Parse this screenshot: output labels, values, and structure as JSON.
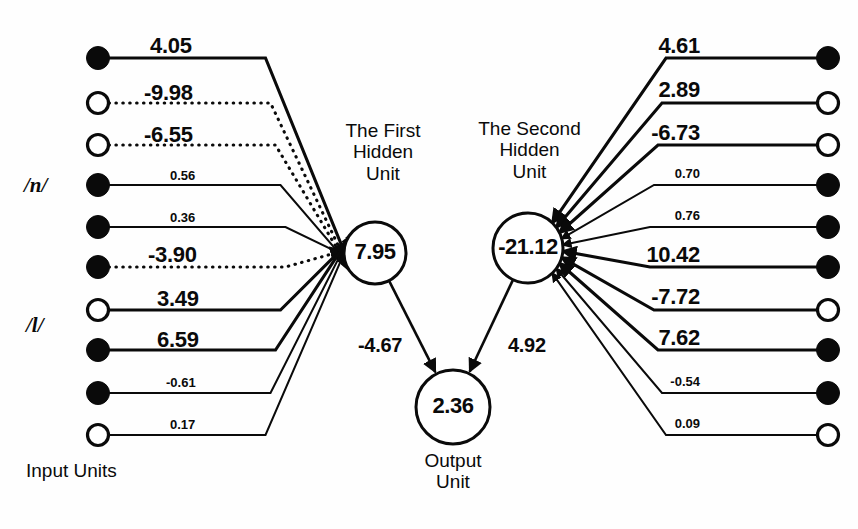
{
  "figure": {
    "type": "neural-network-diagram",
    "canvas": {
      "width": 858,
      "height": 529
    },
    "ink_color": "#0a0a0a",
    "background_color": "#fefefe"
  },
  "captions": {
    "first_hidden": "The First\nHidden\nUnit",
    "first_hidden_line1": "The First",
    "first_hidden_line2": "Hidden",
    "first_hidden_line3": "Unit",
    "second_hidden_line1": "The Second",
    "second_hidden_line2": "Hidden",
    "second_hidden_line3": "Unit",
    "output_line1": "Output",
    "output_line2": "Unit",
    "input_units": "Input  Units",
    "phoneme_n": "/n/",
    "phoneme_l": "/l/"
  },
  "units": {
    "first_hidden": {
      "label": "7.95",
      "cx": 375,
      "cy": 253,
      "r": 31
    },
    "second_hidden": {
      "label": "-21.12",
      "cx": 528,
      "cy": 248,
      "r": 35
    },
    "output": {
      "label": "2.36",
      "cx": 453,
      "cy": 407,
      "r": 37
    }
  },
  "inter_unit_weights": [
    {
      "name": "first-hidden-to-output",
      "value": "-4.67",
      "x": 358,
      "y": 334,
      "size": "mid"
    },
    {
      "name": "second-hidden-to-output",
      "value": "4.92",
      "x": 508,
      "y": 334,
      "size": "mid"
    }
  ],
  "left_inputs": {
    "node_x": 98,
    "label_x": 150,
    "nodes": [
      {
        "index": 0,
        "y": 58,
        "fill": "filled",
        "weight": "4.05",
        "line": "solid",
        "size": "big",
        "label_x": 150,
        "label_y": 33
      },
      {
        "index": 1,
        "y": 103,
        "fill": "open",
        "weight": "-9.98",
        "line": "dotted",
        "size": "big",
        "label_x": 144,
        "label_y": 80
      },
      {
        "index": 2,
        "y": 145,
        "fill": "open",
        "weight": "-6.55",
        "line": "dotted",
        "size": "big",
        "label_x": 144,
        "label_y": 122
      },
      {
        "index": 3,
        "y": 185,
        "fill": "filled",
        "weight": "0.56",
        "line": "solid",
        "size": "small",
        "label_x": 170,
        "label_y": 168
      },
      {
        "index": 4,
        "y": 227,
        "fill": "filled",
        "weight": "0.36",
        "line": "solid",
        "size": "small",
        "label_x": 170,
        "label_y": 210
      },
      {
        "index": 5,
        "y": 267,
        "fill": "filled",
        "weight": "-3.90",
        "line": "dotted",
        "size": "big",
        "label_x": 148,
        "label_y": 242
      },
      {
        "index": 6,
        "y": 310,
        "fill": "open",
        "weight": "3.49",
        "line": "solid",
        "size": "big",
        "label_x": 157,
        "label_y": 286
      },
      {
        "index": 7,
        "y": 350,
        "fill": "filled",
        "weight": "6.59",
        "line": "solid",
        "size": "big",
        "label_x": 157,
        "label_y": 327
      },
      {
        "index": 8,
        "y": 393,
        "fill": "filled",
        "weight": "-0.61",
        "line": "solid",
        "size": "small",
        "label_x": 166,
        "label_y": 375
      },
      {
        "index": 9,
        "y": 435,
        "fill": "open",
        "weight": "0.17",
        "line": "solid",
        "size": "small",
        "label_x": 170,
        "label_y": 417
      }
    ]
  },
  "right_inputs": {
    "node_x": 828,
    "nodes": [
      {
        "index": 0,
        "y": 58,
        "fill": "filled",
        "weight": "4.61",
        "line": "solid",
        "size": "big",
        "label_x": 700,
        "label_y": 33
      },
      {
        "index": 1,
        "y": 103,
        "fill": "open",
        "weight": "2.89",
        "line": "solid",
        "size": "big",
        "label_x": 700,
        "label_y": 77
      },
      {
        "index": 2,
        "y": 145,
        "fill": "open",
        "weight": "-6.73",
        "line": "solid",
        "size": "big",
        "label_x": 700,
        "label_y": 120
      },
      {
        "index": 3,
        "y": 185,
        "fill": "filled",
        "weight": "0.70",
        "line": "solid",
        "size": "small",
        "label_x": 700,
        "label_y": 166
      },
      {
        "index": 4,
        "y": 227,
        "fill": "filled",
        "weight": "0.76",
        "line": "solid",
        "size": "small",
        "label_x": 700,
        "label_y": 208
      },
      {
        "index": 5,
        "y": 267,
        "fill": "filled",
        "weight": "10.42",
        "line": "solid",
        "size": "big",
        "label_x": 700,
        "label_y": 242
      },
      {
        "index": 6,
        "y": 310,
        "fill": "open",
        "weight": "-7.72",
        "line": "solid",
        "size": "big",
        "label_x": 700,
        "label_y": 284
      },
      {
        "index": 7,
        "y": 350,
        "fill": "filled",
        "weight": "7.62",
        "line": "solid",
        "size": "big",
        "label_x": 700,
        "label_y": 325
      },
      {
        "index": 8,
        "y": 393,
        "fill": "filled",
        "weight": "-0.54",
        "line": "solid",
        "size": "small",
        "label_x": 700,
        "label_y": 374
      },
      {
        "index": 9,
        "y": 435,
        "fill": "open",
        "weight": "0.09",
        "line": "solid",
        "size": "small",
        "label_x": 700,
        "label_y": 416
      }
    ]
  },
  "chart_data": {
    "type": "diagram",
    "network": {
      "input_unit_count": 10,
      "hidden_units": [
        {
          "name": "The First Hidden Unit",
          "activation": 7.95
        },
        {
          "name": "The Second Hidden Unit",
          "activation": -21.12
        }
      ],
      "output_units": [
        {
          "name": "Output Unit",
          "activation": 2.36
        }
      ],
      "left_weights": [
        4.05,
        -9.98,
        -6.55,
        0.56,
        0.36,
        -3.9,
        3.49,
        6.59,
        -0.61,
        0.17
      ],
      "right_weights": [
        4.61,
        2.89,
        -6.73,
        0.7,
        0.76,
        10.42,
        -7.72,
        7.62,
        -0.54,
        0.09
      ],
      "hidden_to_output_weights": [
        -4.67,
        4.92
      ],
      "input_node_states_left": [
        "filled",
        "open",
        "open",
        "filled",
        "filled",
        "filled",
        "open",
        "filled",
        "filled",
        "open"
      ],
      "input_node_states_right": [
        "filled",
        "open",
        "open",
        "filled",
        "filled",
        "filled",
        "open",
        "filled",
        "filled",
        "open"
      ],
      "phoneme_groups": [
        "/n/",
        "/l/"
      ]
    }
  }
}
